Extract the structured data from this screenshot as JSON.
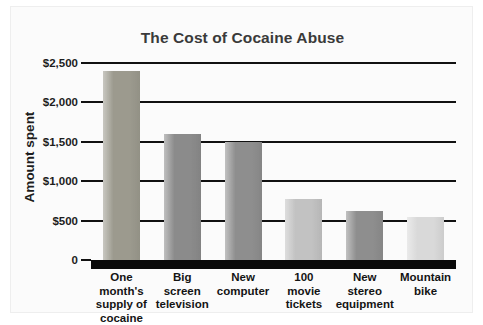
{
  "chart_data": {
    "type": "bar",
    "title": "The Cost of Cocaine Abuse",
    "xlabel": "",
    "ylabel": "Amount spent",
    "categories": [
      "One month's\nsupply of\ncocaine",
      "Big\nscreen\ntelevision",
      "New\ncomputer",
      "100\nmovie\ntickets",
      "New\nstereo\nequipment",
      "Mountain\nbike"
    ],
    "values": [
      2400,
      1600,
      1500,
      780,
      620,
      540
    ],
    "ylim": [
      0,
      2500
    ],
    "yticks": [
      0,
      500,
      1000,
      1500,
      2000,
      2500
    ],
    "ytick_labels": [
      "0",
      "$500",
      "$1,000",
      "$1,500",
      "$2,000",
      "$2,500"
    ],
    "grid": true,
    "legend": "none",
    "bar_colors": [
      "#9c9a8e",
      "#8b8b8b",
      "#8e8e8e",
      "#c2c2c2",
      "#8e8e8e",
      "#d9d9d9"
    ],
    "axis_color": "#111111",
    "baseline_color": "#0a0a0a",
    "background_color": "#fbfbfb",
    "title_color": "#3a3a3a"
  }
}
